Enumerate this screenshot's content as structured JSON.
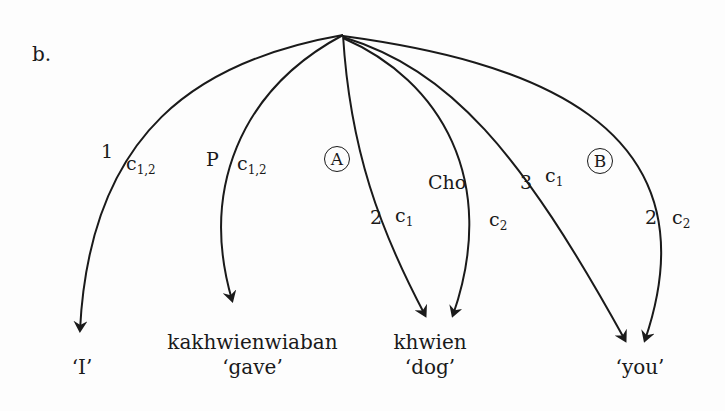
{
  "example_label": "b.",
  "arcs": [
    {
      "label": "1",
      "sub_base": "c",
      "sub": "1,2",
      "target": "I"
    },
    {
      "label": "P",
      "sub_base": "c",
      "sub": "1,2",
      "target": "kakhwienwiaban"
    },
    {
      "label": "2",
      "sub_base": "c",
      "sub": "1",
      "target": "khwien",
      "circle": "A"
    },
    {
      "label": "Cho",
      "sub_base": "c",
      "sub": "2",
      "target": "khwien"
    },
    {
      "label": "3",
      "sub_base": "c",
      "sub": "1",
      "target": "you"
    },
    {
      "label": "2",
      "sub_base": "c",
      "sub": "2",
      "target": "you",
      "circle": "B"
    }
  ],
  "circles": {
    "a": "A",
    "b": "B"
  },
  "words": [
    {
      "form": "",
      "gloss": "‘I’"
    },
    {
      "form": "kakhwienwiaban",
      "gloss": "‘gave’"
    },
    {
      "form": "khwien",
      "gloss": "‘dog’"
    },
    {
      "form": "",
      "gloss": "‘you’"
    }
  ]
}
